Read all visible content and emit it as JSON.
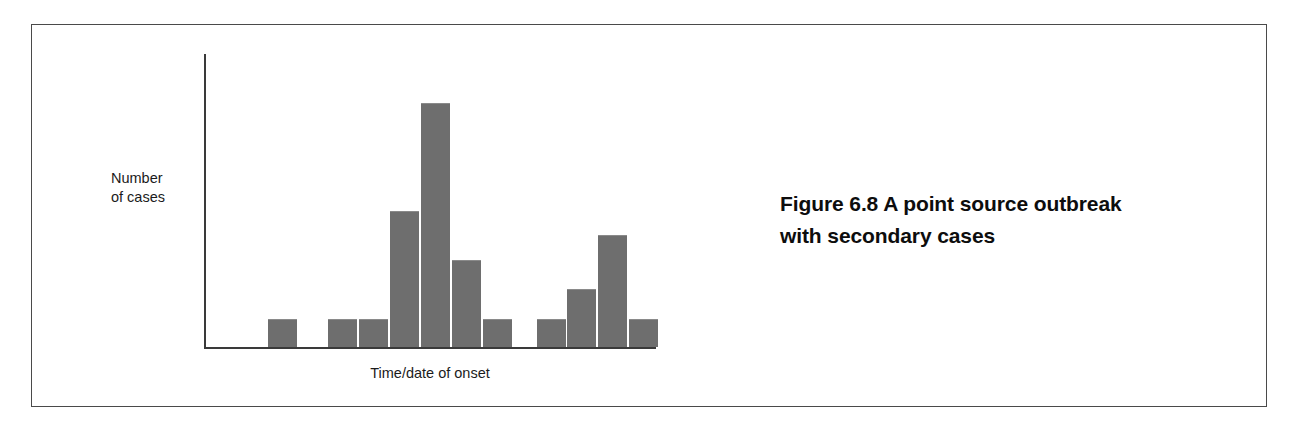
{
  "figure": {
    "caption_prefix": "Figure 6.8",
    "caption_text": "A point source outbreak with secondary cases",
    "caption_full": "Figure 6.8  A point source outbreak with secondary cases",
    "caption_line1": "Figure 6.8  A point source outbreak",
    "caption_line2": "with secondary cases"
  },
  "axes": {
    "y_label_line1": "Number",
    "y_label_line2": "of cases",
    "y_label": "Number of cases",
    "x_label": "Time/date of onset"
  },
  "colors": {
    "bar_fill": "#6e6e6e",
    "axis": "#3a3a3a",
    "frame": "#4a4a4a",
    "text": "#0d0d0d",
    "background": "#ffffff"
  },
  "chart_data": {
    "type": "bar",
    "title": "Figure 6.8  A point source outbreak with secondary cases",
    "xlabel": "Time/date of onset",
    "ylabel": "Number of cases",
    "grid": false,
    "legend": false,
    "xlim": [
      0,
      16
    ],
    "ylim": [
      0,
      9
    ],
    "categories": [
      "1",
      "2",
      "3",
      "4",
      "5",
      "6",
      "7",
      "8",
      "9",
      "10",
      "11",
      "12",
      "13",
      "14",
      "15"
    ],
    "values": [
      0,
      1,
      0,
      1,
      1,
      5,
      9,
      3,
      1,
      0,
      1,
      2,
      4,
      1,
      0
    ],
    "bars": [
      {
        "index": 2,
        "value": 1,
        "left_pct": 14.2,
        "width_pct": 6.4,
        "height_pct": 9.2
      },
      {
        "index": 4,
        "value": 1,
        "left_pct": 27.4,
        "width_pct": 6.4,
        "height_pct": 9.2
      },
      {
        "index": 5,
        "value": 1,
        "left_pct": 34.3,
        "width_pct": 6.4,
        "height_pct": 9.2
      },
      {
        "index": 6,
        "value": 5,
        "left_pct": 41.2,
        "width_pct": 6.4,
        "height_pct": 45.8
      },
      {
        "index": 7,
        "value": 9,
        "left_pct": 48.0,
        "width_pct": 6.4,
        "height_pct": 82.4
      },
      {
        "index": 8,
        "value": 3,
        "left_pct": 54.9,
        "width_pct": 6.4,
        "height_pct": 29.2
      },
      {
        "index": 9,
        "value": 1,
        "left_pct": 61.7,
        "width_pct": 6.4,
        "height_pct": 9.2
      },
      {
        "index": 11,
        "value": 1,
        "left_pct": 73.7,
        "width_pct": 6.4,
        "height_pct": 9.2
      },
      {
        "index": 12,
        "value": 2,
        "left_pct": 80.3,
        "width_pct": 6.4,
        "height_pct": 19.3
      },
      {
        "index": 13,
        "value": 4,
        "left_pct": 87.2,
        "width_pct": 6.4,
        "height_pct": 37.6
      },
      {
        "index": 14,
        "value": 1,
        "left_pct": 94.0,
        "width_pct": 6.4,
        "height_pct": 9.2
      }
    ],
    "annotations": []
  }
}
